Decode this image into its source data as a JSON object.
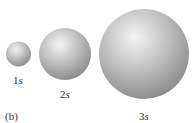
{
  "figure_label": "(b)",
  "orbitals": [
    {
      "name": "1s",
      "number": "1",
      "letter": "s"
    },
    {
      "name": "2s",
      "number": "2",
      "letter": "s"
    },
    {
      "name": "3s",
      "number": "3",
      "letter": "s"
    }
  ],
  "colors": {
    "sphere_light": "#f2f2f2",
    "sphere_mid": "#bdbdbd",
    "sphere_dark": "#8a8a8a"
  }
}
